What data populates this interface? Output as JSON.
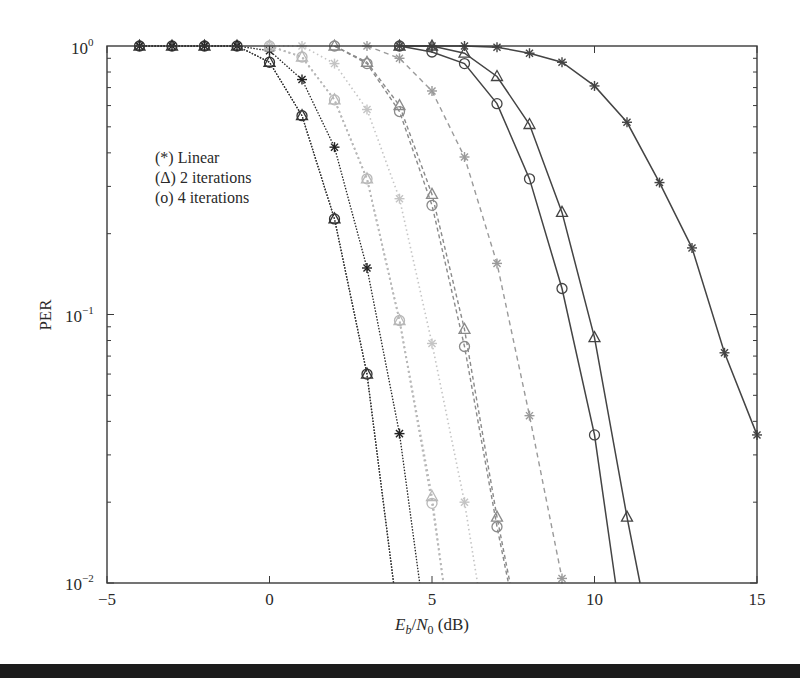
{
  "chart_data": {
    "type": "line",
    "title": "",
    "xlabel": "E_b/N_0 (dB)",
    "xlabel_parts": {
      "E": "E",
      "b": "b",
      "slash": "/",
      "N": "N",
      "zero": "0",
      "unit": " (dB)"
    },
    "ylabel": "PER",
    "xscale": "linear",
    "yscale": "log",
    "xlim": [
      -5,
      15
    ],
    "ylim": [
      0.01,
      1
    ],
    "xticks": [
      -5,
      0,
      5,
      10,
      15
    ],
    "xtick_labels": [
      "−5",
      "0",
      "5",
      "10",
      "15"
    ],
    "yticks": [
      0.01,
      0.1,
      1
    ],
    "ytick_labels": [
      {
        "base": "10",
        "exp": "−2"
      },
      {
        "base": "10",
        "exp": "−1"
      },
      {
        "base": "10",
        "exp": "0"
      }
    ],
    "grid": false,
    "legend": {
      "position": "upper-left (inside)",
      "entries": [
        {
          "symbol": "(*)",
          "label": "Linear"
        },
        {
          "symbol": "(Δ)",
          "label": "2 iterations"
        },
        {
          "symbol": "(o)",
          "label": "4 iterations"
        }
      ]
    },
    "series": [
      {
        "name": "Group A - 4 iterations",
        "marker": "circle",
        "color": "#333333",
        "dash": "1.5,1.5",
        "width": 1.3,
        "x": [
          -4,
          -3,
          -2,
          -1,
          0,
          1,
          2,
          3,
          3.82
        ],
        "y": [
          1,
          1,
          1,
          1,
          0.87,
          0.55,
          0.227,
          0.06,
          0.01
        ]
      },
      {
        "name": "Group A - 2 iterations",
        "marker": "triangle",
        "color": "#333333",
        "dash": "1.5,1.5",
        "width": 1.3,
        "x": [
          -4,
          -3,
          -2,
          -1,
          0,
          1,
          2,
          3,
          3.82
        ],
        "y": [
          1,
          1,
          1,
          1,
          0.87,
          0.55,
          0.227,
          0.06,
          0.01
        ]
      },
      {
        "name": "Group A - Linear",
        "marker": "star",
        "color": "#222222",
        "dash": "1.5,1.5",
        "width": 1.3,
        "x": [
          -4,
          -3,
          -2,
          -1,
          0,
          1,
          2,
          3,
          4,
          4.62
        ],
        "y": [
          1,
          1,
          1,
          1,
          0.96,
          0.75,
          0.42,
          0.149,
          0.036,
          0.01
        ]
      },
      {
        "name": "Group B - 4 iterations",
        "marker": "circle",
        "color": "#b8b8b8",
        "dash": "2,3",
        "width": 1.8,
        "x": [
          0,
          1,
          2,
          3,
          4,
          5,
          5.35
        ],
        "y": [
          1,
          0.91,
          0.63,
          0.32,
          0.095,
          0.0198,
          0.01
        ]
      },
      {
        "name": "Group B - 2 iterations",
        "marker": "triangle",
        "color": "#b8b8b8",
        "dash": "2,3",
        "width": 1.8,
        "x": [
          0,
          1,
          2,
          3,
          4,
          5,
          5.35
        ],
        "y": [
          1,
          0.91,
          0.63,
          0.32,
          0.095,
          0.021,
          0.01
        ]
      },
      {
        "name": "Group B - Linear",
        "marker": "star",
        "color": "#c4c4c4",
        "dash": "1.5,3",
        "width": 1.6,
        "x": [
          0,
          1,
          2,
          3,
          4,
          5,
          6,
          6.4
        ],
        "y": [
          1,
          1,
          0.86,
          0.58,
          0.27,
          0.078,
          0.02,
          0.01
        ]
      },
      {
        "name": "Group C - 4 iterations",
        "marker": "circle",
        "color": "#8a8a8a",
        "dash": "4,3",
        "width": 1.4,
        "x": [
          2,
          3,
          4,
          5,
          6,
          7,
          7.35
        ],
        "y": [
          1,
          0.86,
          0.57,
          0.255,
          0.076,
          0.0162,
          0.01
        ]
      },
      {
        "name": "Group C - 2 iterations",
        "marker": "triangle",
        "color": "#8a8a8a",
        "dash": "4,3",
        "width": 1.4,
        "x": [
          2,
          3,
          4,
          5,
          6,
          7,
          7.4
        ],
        "y": [
          1,
          0.87,
          0.6,
          0.28,
          0.088,
          0.0176,
          0.01
        ]
      },
      {
        "name": "Group C - Linear",
        "marker": "star",
        "color": "#9a9a9a",
        "dash": "5,4",
        "width": 1.4,
        "x": [
          3,
          4,
          5,
          6,
          7,
          8,
          9
        ],
        "y": [
          1,
          0.9,
          0.68,
          0.386,
          0.155,
          0.042,
          0.0104
        ]
      },
      {
        "name": "Group D - 4 iterations",
        "marker": "circle",
        "color": "#444444",
        "dash": "",
        "width": 1.5,
        "x": [
          4,
          5,
          6,
          7,
          8,
          9,
          10,
          10.65
        ],
        "y": [
          1,
          0.95,
          0.86,
          0.61,
          0.32,
          0.125,
          0.0356,
          0.01
        ]
      },
      {
        "name": "Group D - 2 iterations",
        "marker": "triangle",
        "color": "#444444",
        "dash": "",
        "width": 1.5,
        "x": [
          4,
          5,
          6,
          7,
          8,
          9,
          10,
          11,
          11.4
        ],
        "y": [
          1,
          1,
          0.94,
          0.77,
          0.51,
          0.24,
          0.082,
          0.0176,
          0.01
        ]
      },
      {
        "name": "Group D - Linear",
        "marker": "star",
        "color": "#444444",
        "dash": "",
        "width": 1.5,
        "x": [
          4,
          5,
          6,
          7,
          8,
          9,
          10,
          11,
          12,
          13,
          14,
          15
        ],
        "y": [
          1,
          1,
          1,
          0.99,
          0.94,
          0.87,
          0.71,
          0.52,
          0.31,
          0.177,
          0.072,
          0.0356
        ]
      }
    ]
  }
}
